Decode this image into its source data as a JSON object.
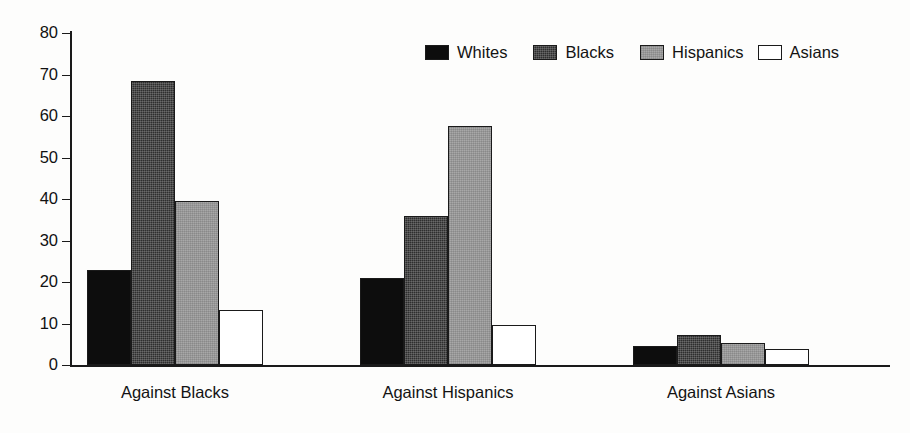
{
  "chart_data": {
    "type": "bar",
    "title": "",
    "subtitle": "",
    "xlabel": "",
    "ylabel": "",
    "ylim": [
      0,
      80
    ],
    "ytick_labels": [
      "80",
      "70",
      "60",
      "50",
      "40",
      "30",
      "20",
      "10",
      "0"
    ],
    "ytick_values": [
      80,
      70,
      60,
      50,
      40,
      30,
      20,
      10,
      0
    ],
    "grid": false,
    "legend_position": "top-right",
    "categories": [
      "Against Blacks",
      "Against Hispanics",
      "Against Asians"
    ],
    "series": [
      {
        "name": "Whites",
        "values": [
          23.0,
          21.0,
          4.7
        ]
      },
      {
        "name": "Blacks",
        "values": [
          68.5,
          36.0,
          7.2
        ]
      },
      {
        "name": "Hispanics",
        "values": [
          39.5,
          57.5,
          5.3
        ]
      },
      {
        "name": "Asians",
        "values": [
          13.3,
          9.6,
          3.9
        ]
      }
    ],
    "series_colors": [
      "#0d0d0d",
      "#2e2e2e",
      "#a8a8a8",
      "#ffffff"
    ],
    "annotations": []
  },
  "legend": {
    "items": [
      {
        "label": "Whites"
      },
      {
        "label": "Blacks"
      },
      {
        "label": "Hispanics"
      },
      {
        "label": "Asians"
      }
    ]
  },
  "axis": {
    "y_labels": [
      "80",
      "70",
      "60",
      "50",
      "40",
      "30",
      "20",
      "10",
      "0"
    ]
  },
  "groups": [
    {
      "label": "Against Blacks"
    },
    {
      "label": "Against Hispanics"
    },
    {
      "label": "Against Asians"
    }
  ]
}
